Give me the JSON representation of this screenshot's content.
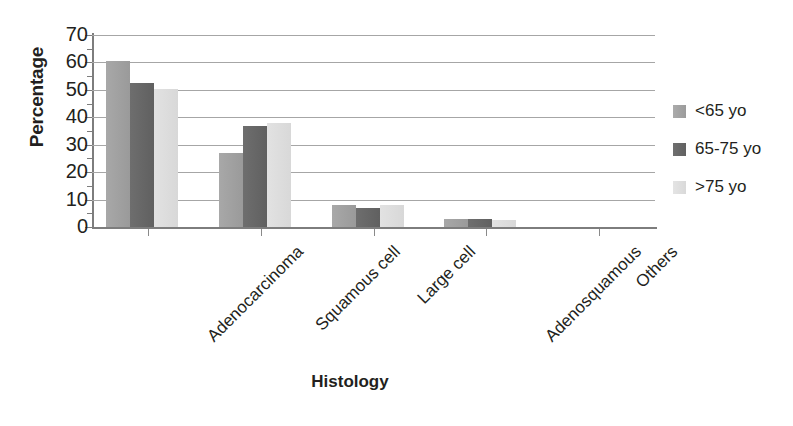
{
  "chart_data": {
    "type": "bar",
    "title": "",
    "subtitle": "",
    "xlabel": "Histology",
    "ylabel": "Percentage",
    "categories": [
      "Adenocarcinoma",
      "Squamous cell",
      "Large cell",
      "Adenosquamous",
      "Others"
    ],
    "series": [
      {
        "name": "<65 yo",
        "color": "#a0a0a0",
        "values": [
          60.5,
          27.0,
          8.0,
          3.0,
          0.0
        ]
      },
      {
        "name": "65-75 yo",
        "color": "#676767",
        "values": [
          52.5,
          37.0,
          7.0,
          3.0,
          0.0
        ]
      },
      {
        "name": ">75 yo",
        "color": "#dddddd",
        "values": [
          50.5,
          38.0,
          8.0,
          2.5,
          0.0
        ]
      }
    ],
    "ylim": [
      0,
      70
    ],
    "ytick_labels": [
      "0",
      "10",
      "20",
      "30",
      "40",
      "50",
      "60",
      "70"
    ],
    "ytick_values": [
      0,
      10,
      20,
      30,
      40,
      50,
      60,
      70
    ],
    "grid": true,
    "grid_axis": "y",
    "legend_position": "right",
    "xtick_label_rotation": -45,
    "background_color": "#ffffff",
    "axis_color": "#7d7d7d",
    "gridline_color": "#a6a6a6",
    "text_color": "#231f20"
  }
}
